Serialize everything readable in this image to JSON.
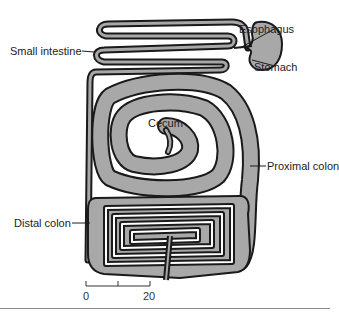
{
  "figure": {
    "labels": {
      "small_intestine": "Small intestine",
      "esophagus": "Esophagus",
      "stomach": "Stomach",
      "cecum": "Cecum",
      "proximal_colon": "Proximal colon",
      "distal_colon": "Distal colon"
    },
    "scale_bar": {
      "start": "0",
      "end": "20"
    },
    "colors": {
      "organ_fill": "#a8a8a8",
      "outline": "#1a1a1a",
      "lumen": "#ffffff"
    }
  }
}
